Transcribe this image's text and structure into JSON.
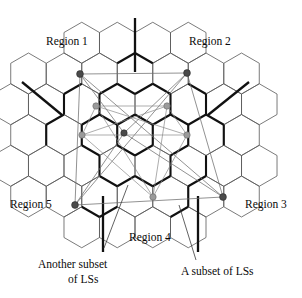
{
  "figure": {
    "background_color": "#ffffff",
    "region_labels": [
      {
        "id": "region-1",
        "text": "Region 1",
        "x": 46,
        "y": 45,
        "anchor": "start"
      },
      {
        "id": "region-2",
        "text": "Region 2",
        "x": 189,
        "y": 45,
        "anchor": "start"
      },
      {
        "id": "region-3",
        "text": "Region 3",
        "x": 245,
        "y": 208,
        "anchor": "start"
      },
      {
        "id": "region-4",
        "text": "Region 4",
        "x": 129,
        "y": 241,
        "anchor": "start"
      },
      {
        "id": "region-5",
        "text": "Region 5",
        "x": 10,
        "y": 208,
        "anchor": "start"
      }
    ],
    "callouts": [
      {
        "id": "another-subset-of-ls",
        "line1": "Another subset",
        "line2": "of LSs",
        "x": 38,
        "y": 268,
        "line2_x": 68,
        "line2_y": 283,
        "leader": {
          "x1": 104,
          "y1": 248,
          "x2": 128,
          "y2": 185
        }
      },
      {
        "id": "a-subset-of-ls",
        "line1": "A subset of LSs",
        "line2": "",
        "x": 181,
        "y": 275,
        "line2_x": 0,
        "line2_y": 0,
        "leader": {
          "x1": 196,
          "y1": 260,
          "x2": 179,
          "y2": 205
        }
      }
    ],
    "colors": {
      "hex_stroke": "#595959",
      "hex_bold_stroke": "#111111",
      "spoke": "#111111",
      "ls_edge": "#8a8a8a",
      "node_dark": "#4a4a4a",
      "node_gray": "#9a9a9a",
      "text": "#0a0a0a"
    },
    "grid": {
      "type": "hexagonal-tessellation",
      "orientation": "pointy-top-row-offset",
      "hex_radius": 20.5,
      "center": {
        "x": 135,
        "y": 135
      },
      "columns": 9,
      "rows": 7
    },
    "nodes_dark": [
      {
        "id": "ls-dark-1",
        "x": 80,
        "y": 74,
        "r": 3.4,
        "label": "Region 1 LS"
      },
      {
        "id": "ls-dark-2",
        "x": 187,
        "y": 73,
        "r": 3.4,
        "label": "Region 2 LS"
      },
      {
        "id": "ls-dark-3",
        "x": 223,
        "y": 197,
        "r": 3.4,
        "label": "Region 3 LS"
      },
      {
        "id": "ls-dark-4",
        "x": 124,
        "y": 133,
        "r": 3.2,
        "label": "Center LS"
      },
      {
        "id": "ls-dark-5",
        "x": 75,
        "y": 205,
        "r": 3.4,
        "label": "Region 5 LS"
      }
    ],
    "nodes_gray": [
      {
        "id": "ls-gray-1",
        "x": 96,
        "y": 106,
        "r": 3.2,
        "label": "subset LS upper-left"
      },
      {
        "id": "ls-gray-2",
        "x": 167,
        "y": 106,
        "r": 3.2,
        "label": "subset LS upper-right"
      },
      {
        "id": "ls-gray-3",
        "x": 187,
        "y": 135,
        "r": 3.2,
        "label": "subset LS right"
      },
      {
        "id": "ls-gray-4",
        "x": 82,
        "y": 135,
        "r": 3.2,
        "label": "subset LS left"
      },
      {
        "id": "ls-gray-5",
        "x": 153,
        "y": 197,
        "r": 3.2,
        "label": "subset LS bottom"
      }
    ],
    "spokes": [
      {
        "id": "spoke-north",
        "x1": 135,
        "y1": 18,
        "x2": 135,
        "y2": 72
      },
      {
        "id": "spoke-northwest",
        "x1": 22,
        "y1": 82,
        "x2": 62,
        "y2": 115
      },
      {
        "id": "spoke-northeast",
        "x1": 249,
        "y1": 82,
        "x2": 208,
        "y2": 115
      },
      {
        "id": "spoke-southwest",
        "x1": 103,
        "y1": 196,
        "x2": 103,
        "y2": 252
      },
      {
        "id": "spoke-southeast",
        "x1": 198,
        "y1": 196,
        "x2": 198,
        "y2": 252
      }
    ]
  }
}
